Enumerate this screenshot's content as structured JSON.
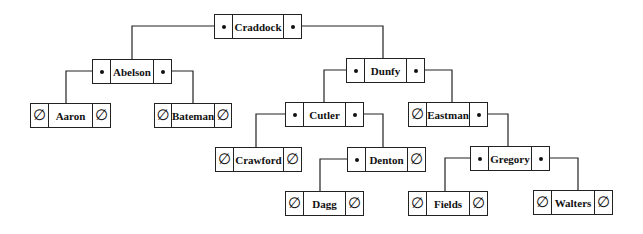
{
  "diagram": {
    "type": "binary-search-tree",
    "null_symbol": "∅",
    "nodes": [
      {
        "id": "craddock",
        "label": "Craddock",
        "left": "abelson",
        "right": "dunfy",
        "x": 214,
        "y": 14,
        "w": 88
      },
      {
        "id": "abelson",
        "label": "Abelson",
        "left": "aaron",
        "right": "bateman",
        "x": 92,
        "y": 59,
        "w": 80
      },
      {
        "id": "dunfy",
        "label": "Dunfy",
        "left": "cutler",
        "right": "eastman",
        "x": 346,
        "y": 58,
        "w": 79
      },
      {
        "id": "aaron",
        "label": "Aaron",
        "left": null,
        "right": null,
        "x": 30,
        "y": 103,
        "w": 81
      },
      {
        "id": "bateman",
        "label": "Bateman",
        "left": null,
        "right": null,
        "x": 154,
        "y": 103,
        "w": 78
      },
      {
        "id": "cutler",
        "label": "Cutler",
        "left": "crawford",
        "right": "denton",
        "x": 285,
        "y": 102,
        "w": 79
      },
      {
        "id": "eastman",
        "label": "Eastman",
        "left": null,
        "right": "gregory",
        "x": 408,
        "y": 102,
        "w": 80
      },
      {
        "id": "crawford",
        "label": "Crawford",
        "left": null,
        "right": null,
        "x": 215,
        "y": 147,
        "w": 87
      },
      {
        "id": "denton",
        "label": "Denton",
        "left": "dagg",
        "right": null,
        "x": 347,
        "y": 147,
        "w": 79
      },
      {
        "id": "gregory",
        "label": "Gregory",
        "left": "fields",
        "right": "walters",
        "x": 470,
        "y": 146,
        "w": 80
      },
      {
        "id": "dagg",
        "label": "Dagg",
        "left": null,
        "right": null,
        "x": 285,
        "y": 191,
        "w": 79
      },
      {
        "id": "fields",
        "label": "Fields",
        "left": null,
        "right": null,
        "x": 408,
        "y": 191,
        "w": 80
      },
      {
        "id": "walters",
        "label": "Walters",
        "left": null,
        "right": null,
        "x": 533,
        "y": 190,
        "w": 80
      }
    ],
    "edges": [
      {
        "from": "craddock",
        "side": "left",
        "to": "abelson",
        "points": "223,26 132,26 132,59"
      },
      {
        "from": "craddock",
        "side": "right",
        "to": "dunfy",
        "points": "293,26 383,26 383,58"
      },
      {
        "from": "abelson",
        "side": "left",
        "to": "aaron",
        "points": "101,71 66,71 66,103"
      },
      {
        "from": "abelson",
        "side": "right",
        "to": "bateman",
        "points": "163,71 193,71 193,103"
      },
      {
        "from": "dunfy",
        "side": "left",
        "to": "cutler",
        "points": "355,70 324,70 324,102"
      },
      {
        "from": "dunfy",
        "side": "right",
        "to": "eastman",
        "points": "416,70 452,70 452,102"
      },
      {
        "from": "cutler",
        "side": "left",
        "to": "crawford",
        "points": "294,114 256,114 256,147"
      },
      {
        "from": "cutler",
        "side": "right",
        "to": "denton",
        "points": "355,114 383,114 383,147"
      },
      {
        "from": "eastman",
        "side": "right",
        "to": "gregory",
        "points": "479,114 508,114 508,146"
      },
      {
        "from": "denton",
        "side": "left",
        "to": "dagg",
        "points": "356,159 320,159 320,191"
      },
      {
        "from": "gregory",
        "side": "left",
        "to": "fields",
        "points": "479,158 445,158 445,191"
      },
      {
        "from": "gregory",
        "side": "right",
        "to": "walters",
        "points": "541,158 578,158 578,190"
      }
    ]
  }
}
